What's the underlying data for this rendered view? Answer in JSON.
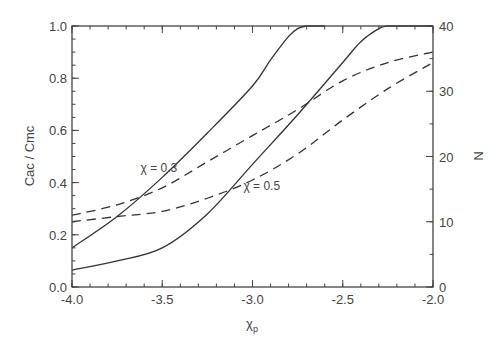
{
  "chart_data": {
    "type": "line",
    "title": "",
    "xlabel": "χp",
    "ylabel": "Cac / Cmc",
    "y2label": "N",
    "xlim": [
      -4.0,
      -2.0
    ],
    "ylim": [
      0.0,
      1.0
    ],
    "y2lim": [
      0,
      40
    ],
    "grid": false,
    "legend": null,
    "x_ticks": [
      "-4.0",
      "-3.5",
      "-3.0",
      "-2.5",
      "-2.0"
    ],
    "y_ticks": [
      "0.0",
      "0.2",
      "0.4",
      "0.6",
      "0.8",
      "1.0"
    ],
    "y2_ticks": [
      "0",
      "10",
      "20",
      "30",
      "40"
    ],
    "annotations": [
      {
        "text": "χ = 0.3",
        "x": -3.62,
        "y": 0.44
      },
      {
        "text": "χ = 0.5",
        "x": -3.05,
        "y": 0.37
      }
    ],
    "series": [
      {
        "name": "Cac/Cmc χ=0.3",
        "style": "solid",
        "axis": "left",
        "x": [
          -4.0,
          -3.75,
          -3.5,
          -3.25,
          -3.0,
          -2.9,
          -2.8,
          -2.75,
          -2.7,
          -2.6
        ],
        "y": [
          0.15,
          0.27,
          0.42,
          0.59,
          0.77,
          0.87,
          0.96,
          0.99,
          1.0,
          1.0
        ]
      },
      {
        "name": "Cac/Cmc χ=0.5",
        "style": "solid",
        "axis": "left",
        "x": [
          -4.0,
          -3.75,
          -3.5,
          -3.25,
          -3.0,
          -2.75,
          -2.5,
          -2.4,
          -2.3,
          -2.25,
          -2.2,
          -2.0
        ],
        "y": [
          0.065,
          0.1,
          0.15,
          0.28,
          0.47,
          0.66,
          0.86,
          0.94,
          0.99,
          1.0,
          1.0,
          1.0
        ]
      },
      {
        "name": "N χ=0.3",
        "style": "dashed",
        "axis": "right",
        "x": [
          -4.0,
          -3.75,
          -3.5,
          -3.25,
          -3.0,
          -2.75,
          -2.5,
          -2.25,
          -2.0
        ],
        "y": [
          11.0,
          12.6,
          15.2,
          19.2,
          23.2,
          27.2,
          31.6,
          34.4,
          36.0
        ]
      },
      {
        "name": "N χ=0.5",
        "style": "dashed",
        "axis": "right",
        "x": [
          -4.0,
          -3.75,
          -3.5,
          -3.25,
          -3.0,
          -2.75,
          -2.5,
          -2.25,
          -2.0
        ],
        "y": [
          10.0,
          10.8,
          11.6,
          13.6,
          16.4,
          20.4,
          25.6,
          30.4,
          34.4
        ]
      }
    ]
  }
}
